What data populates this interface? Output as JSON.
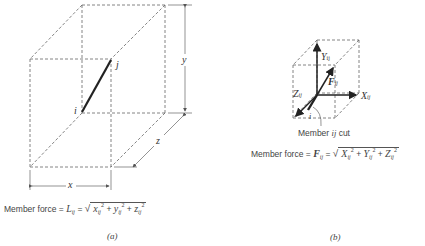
{
  "figure_a": {
    "label_i": "i",
    "label_j": "j",
    "dim_x": "x",
    "dim_y": "y",
    "dim_z": "z",
    "equation": {
      "prefix": "Member force = ",
      "lhs": "L",
      "lhs_sub": "ij",
      "equals": " = ",
      "terms": [
        {
          "var": "x",
          "sub": "ij",
          "sup": "2"
        },
        {
          "var": "y",
          "sub": "ij",
          "sup": "2"
        },
        {
          "var": "z",
          "sub": "ij",
          "sup": "2"
        }
      ],
      "plus": " + "
    },
    "caption": "(a)"
  },
  "figure_b": {
    "label_Y": "Y",
    "label_X": "X",
    "label_Z": "Z",
    "label_F": "F",
    "sub_ij": "ij",
    "label_i": "i",
    "cut_caption_prefix": "Member ",
    "cut_caption_ij": "ij",
    "cut_caption_suffix": " cut",
    "equation": {
      "prefix": "Member force = ",
      "lhs": "F",
      "lhs_sub": "ij",
      "equals": " = ",
      "terms": [
        {
          "var": "X",
          "sub": "ij",
          "sup": "2"
        },
        {
          "var": "Y",
          "sub": "ij",
          "sup": "2"
        },
        {
          "var": "Z",
          "sub": "ij",
          "sup": "2"
        }
      ],
      "plus": " + "
    },
    "caption": "(b)"
  },
  "colors": {
    "line": "#555555",
    "member": "#222222",
    "text": "#444444"
  }
}
